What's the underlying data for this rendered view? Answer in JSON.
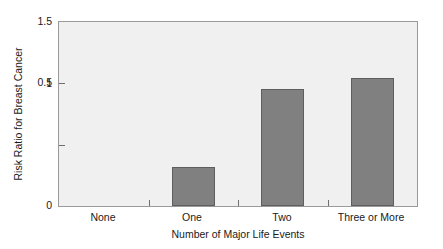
{
  "chart_data": {
    "type": "bar",
    "title": "",
    "xlabel": "Number of Major Life Events",
    "ylabel": "Risk Ratio for Breast Cancer",
    "categories": [
      "None",
      "One",
      "Two",
      "Three or More"
    ],
    "values": [
      0,
      0.32,
      0.95,
      1.04
    ],
    "series": [
      {
        "name": "Risk Ratio for Breast Cancer",
        "values": [
          0,
          0.32,
          0.95,
          1.04
        ]
      }
    ],
    "ylim": [
      0,
      1.5
    ],
    "yticks": [
      "0",
      "0.5",
      "1",
      "1.5"
    ],
    "ytick_values": [
      0,
      0.5,
      1,
      1.5
    ],
    "grid": false,
    "legend": false,
    "legend_position": "none",
    "bar_color": "#808080",
    "bar_edge_color": "#5e5e5e",
    "plot_background": "#f0f0f0",
    "axis_color": "#9a9a9a",
    "figure_background": "#ffffff"
  }
}
